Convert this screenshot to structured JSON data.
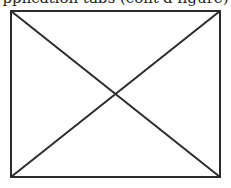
{
  "caption": {
    "text": "pplication tabs (cont'd figure)",
    "note": "partially clipped at top edge"
  },
  "placeholder": {
    "kind": "image-placeholder-x",
    "stroke_color": "#2b2b2b",
    "fill_color": "#ffffff"
  }
}
